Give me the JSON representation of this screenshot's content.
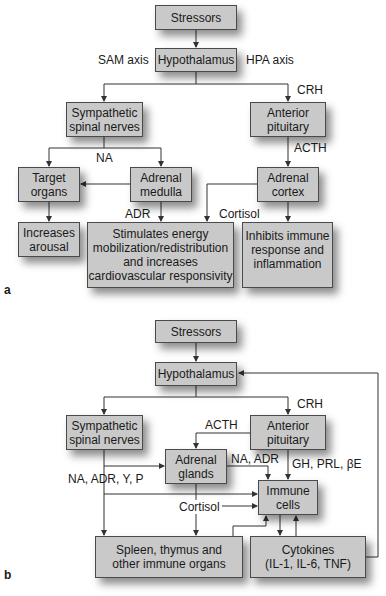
{
  "panel_a": {
    "panel_label": "a",
    "boxes": {
      "stressors": "Stressors",
      "hypothalamus": "Hypothalamus",
      "sympathetic": "Sympathetic\nspinal nerves",
      "anterior_pituitary": "Anterior\npituitary",
      "target_organs": "Target\norgans",
      "adrenal_medulla": "Adrenal\nmedulla",
      "adrenal_cortex": "Adrenal\ncortex",
      "increases_arousal": "Increases\narousal",
      "stimulates": "Stimulates energy\nmobilization/redistribution\nand increases\ncardiovascular responsivity",
      "inhibits": "Inhibits immune\nresponse and\ninflammation"
    },
    "labels": {
      "sam_axis": "SAM axis",
      "hpa_axis": "HPA axis",
      "crh": "CRH",
      "na": "NA",
      "acth": "ACTH",
      "adr": "ADR",
      "cortisol": "Cortisol"
    }
  },
  "panel_b": {
    "panel_label": "b",
    "boxes": {
      "stressors": "Stressors",
      "hypothalamus": "Hypothalamus",
      "sympathetic": "Sympathetic\nspinal nerves",
      "anterior_pituitary": "Anterior\npituitary",
      "adrenal_glands": "Adrenal\nglands",
      "immune_cells": "Immune\ncells",
      "spleen": "Spleen, thymus and\nother immune organs",
      "cytokines": "Cytokines\n(IL-1, IL-6, TNF)"
    },
    "labels": {
      "crh": "CRH",
      "acth": "ACTH",
      "na_adr": "NA, ADR",
      "gh_prl_be": "GH, PRL, βE",
      "na_adr_y_p": "NA, ADR, Y, P",
      "cortisol": "Cortisol"
    }
  },
  "colors": {
    "box_fill": "#c9c9c9",
    "box_border": "#4a4a4a",
    "line": "#333333"
  }
}
